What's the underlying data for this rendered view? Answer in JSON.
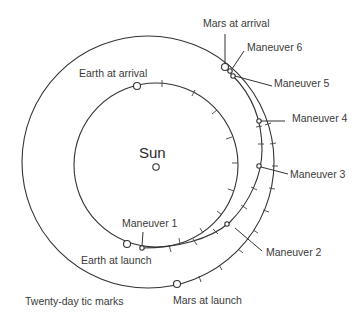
{
  "diagram": {
    "center_label": "Sun",
    "orbits": [
      {
        "name": "Earth orbit"
      },
      {
        "name": "Mars orbit"
      }
    ],
    "labels": {
      "earth_arrival": "Earth at arrival",
      "earth_launch": "Earth at launch",
      "mars_arrival": "Mars at arrival",
      "mars_launch": "Mars at launch",
      "maneuver_1": "Maneuver 1",
      "maneuver_2": "Maneuver 2",
      "maneuver_3": "Maneuver 3",
      "maneuver_4": "Maneuver 4",
      "maneuver_5": "Maneuver 5",
      "maneuver_6": "Maneuver 6"
    },
    "footnote": "Twenty-day tic marks"
  }
}
